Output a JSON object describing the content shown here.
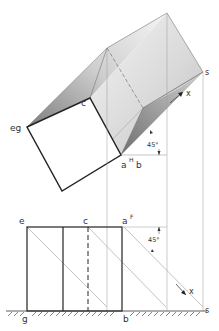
{
  "figure": {
    "type": "descriptive-geometry shadow construction",
    "top_view": {
      "labels": {
        "eg": "eg",
        "c": "c",
        "a": "a",
        "a_sup": "H",
        "b": "b",
        "s": "s",
        "x": "x",
        "angle": "45°"
      }
    },
    "front_view": {
      "labels": {
        "e": "e",
        "c": "c",
        "a": "a",
        "a_sup": "F",
        "g": "g",
        "b": "b",
        "s": "s",
        "x": "x",
        "angle": "45°"
      }
    },
    "colors": {
      "line": "#222222",
      "thin_line": "#999999",
      "shadow_dark": "#8a8a8a",
      "shadow_light": "#f2f2f2"
    }
  }
}
